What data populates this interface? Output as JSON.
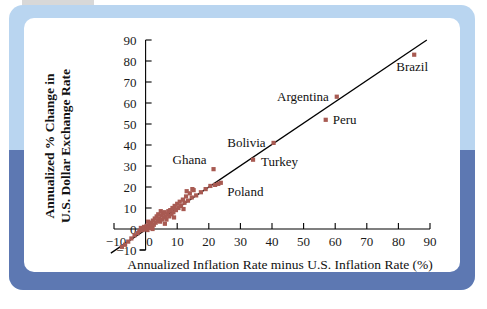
{
  "figure": {
    "frame_colors": {
      "light_blue": "#b9d5f0",
      "dark_blue": "#5d78b2",
      "tab_gray": "#d8d8d8",
      "panel_white": "#ffffff"
    }
  },
  "chart_data": {
    "type": "scatter",
    "title": "",
    "xlabel": "Annualized Inflation Rate minus U.S. Inflation Rate (%)",
    "ylabel": "Annualized % Change in U.S. Dollar Exchange Rate",
    "ylabel_line1": "Annualized % Change in",
    "ylabel_line2": "U.S. Dollar Exchange Rate",
    "xlim": [
      -10,
      90
    ],
    "ylim": [
      -10,
      90
    ],
    "xticks": [
      -10,
      0,
      10,
      20,
      30,
      40,
      50,
      60,
      70,
      80,
      90
    ],
    "yticks": [
      -10,
      0,
      10,
      20,
      30,
      40,
      50,
      60,
      70,
      80,
      90
    ],
    "xtick_labels": [
      "−10",
      "0",
      "10",
      "20",
      "30",
      "40",
      "50",
      "60",
      "70",
      "80",
      "90"
    ],
    "ytick_labels": [
      "−10",
      "0",
      "10",
      "20",
      "30",
      "40",
      "50",
      "60",
      "70",
      "80",
      "90"
    ],
    "grid": false,
    "legend": false,
    "marker_color": "#a85a52",
    "marker_shape": "square",
    "trendline": {
      "x0": -11,
      "y0": -11.5,
      "x1": 89,
      "y1": 90,
      "color": "#000000"
    },
    "labeled_points": [
      {
        "label": "Brazil",
        "x": 85.0,
        "y": 83.0,
        "label_dx": -2,
        "label_dy": 16,
        "anchor": "middle"
      },
      {
        "label": "Argentina",
        "x": 60.5,
        "y": 63.0,
        "label_dx": -8,
        "label_dy": 4,
        "anchor": "end"
      },
      {
        "label": "Peru",
        "x": 57.0,
        "y": 52.0,
        "label_dx": 7,
        "label_dy": 4,
        "anchor": "start"
      },
      {
        "label": "Bolivia",
        "x": 40.5,
        "y": 41.0,
        "label_dx": -8,
        "label_dy": 4,
        "anchor": "end"
      },
      {
        "label": "Turkey",
        "x": 34.0,
        "y": 33.0,
        "label_dx": 8,
        "label_dy": 6,
        "anchor": "start"
      },
      {
        "label": "Poland",
        "x": 23.0,
        "y": 21.5,
        "label_dx": 9,
        "label_dy": 12,
        "anchor": "start"
      },
      {
        "label": "Ghana",
        "x": 21.5,
        "y": 28.5,
        "label_dx": -7,
        "label_dy": -5,
        "anchor": "end"
      }
    ],
    "cluster_points": [
      {
        "x": -5.5,
        "y": -6.0
      },
      {
        "x": -4.5,
        "y": -4.5
      },
      {
        "x": -3.5,
        "y": -3.0
      },
      {
        "x": -2.5,
        "y": -2.0
      },
      {
        "x": -2.0,
        "y": -1.0
      },
      {
        "x": -1.5,
        "y": 0.5
      },
      {
        "x": -1.0,
        "y": -0.5
      },
      {
        "x": -0.5,
        "y": 1.0
      },
      {
        "x": 0.0,
        "y": 0.0
      },
      {
        "x": 0.3,
        "y": 1.5
      },
      {
        "x": 0.6,
        "y": -0.5
      },
      {
        "x": 1.0,
        "y": 1.0
      },
      {
        "x": 1.2,
        "y": 2.5
      },
      {
        "x": 1.5,
        "y": 0.5
      },
      {
        "x": 1.8,
        "y": 3.0
      },
      {
        "x": 2.0,
        "y": 1.5
      },
      {
        "x": 2.3,
        "y": 4.0
      },
      {
        "x": 2.6,
        "y": 2.0
      },
      {
        "x": 2.9,
        "y": 5.0
      },
      {
        "x": 3.2,
        "y": 3.0
      },
      {
        "x": 3.5,
        "y": 6.0
      },
      {
        "x": 3.8,
        "y": 4.0
      },
      {
        "x": 4.0,
        "y": 7.0
      },
      {
        "x": 4.3,
        "y": 5.0
      },
      {
        "x": 4.6,
        "y": 3.5
      },
      {
        "x": 5.0,
        "y": 6.5
      },
      {
        "x": 5.2,
        "y": 4.5
      },
      {
        "x": 5.5,
        "y": 7.5
      },
      {
        "x": 5.8,
        "y": 5.5
      },
      {
        "x": 6.0,
        "y": 8.0
      },
      {
        "x": 6.3,
        "y": 6.0
      },
      {
        "x": 6.6,
        "y": 4.5
      },
      {
        "x": 6.9,
        "y": 7.0
      },
      {
        "x": 7.2,
        "y": 8.5
      },
      {
        "x": 7.5,
        "y": 6.0
      },
      {
        "x": 7.8,
        "y": 9.0
      },
      {
        "x": 8.2,
        "y": 7.0
      },
      {
        "x": 8.5,
        "y": 10.0
      },
      {
        "x": 8.8,
        "y": 8.0
      },
      {
        "x": 9.2,
        "y": 11.0
      },
      {
        "x": 9.6,
        "y": 9.0
      },
      {
        "x": 10.0,
        "y": 12.0
      },
      {
        "x": 10.4,
        "y": 10.0
      },
      {
        "x": 10.8,
        "y": 13.0
      },
      {
        "x": 11.2,
        "y": 11.0
      },
      {
        "x": 11.8,
        "y": 14.0
      },
      {
        "x": 12.3,
        "y": 12.5
      },
      {
        "x": 12.8,
        "y": 15.5
      },
      {
        "x": 13.4,
        "y": 13.5
      },
      {
        "x": 14.0,
        "y": 17.0
      },
      {
        "x": 14.6,
        "y": 15.0
      },
      {
        "x": 15.2,
        "y": 18.5
      },
      {
        "x": 16.0,
        "y": 16.0
      },
      {
        "x": 17.5,
        "y": 17.5
      },
      {
        "x": 19.0,
        "y": 19.0
      },
      {
        "x": 20.5,
        "y": 20.5
      },
      {
        "x": 22.0,
        "y": 21.0
      },
      {
        "x": 23.8,
        "y": 22.0
      },
      {
        "x": -6.5,
        "y": -7.5
      },
      {
        "x": -7.5,
        "y": -8.5
      },
      {
        "x": 0.8,
        "y": 3.5
      },
      {
        "x": 2.2,
        "y": 0.0
      },
      {
        "x": 4.8,
        "y": 8.5
      },
      {
        "x": 6.1,
        "y": 2.5
      },
      {
        "x": 9.0,
        "y": 5.5
      },
      {
        "x": 12.0,
        "y": 9.5
      },
      {
        "x": 13.0,
        "y": 18.0
      },
      {
        "x": 14.8,
        "y": 19.0
      }
    ]
  }
}
